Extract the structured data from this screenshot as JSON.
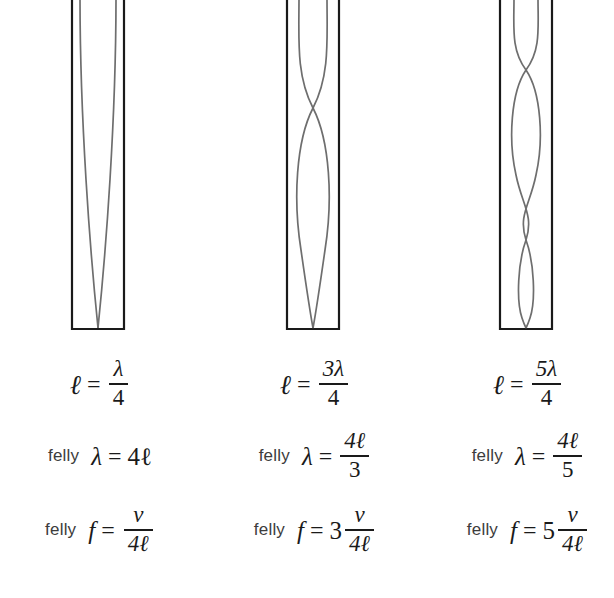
{
  "figure": {
    "type": "physics-diagram",
    "background_color": "#ffffff",
    "tube_outline_color": "#1a1a1a",
    "wave_color": "#6e6e6e"
  },
  "columns": [
    {
      "id": "harmonic-1",
      "tube": {
        "closed_end": "bottom",
        "open_end": "top",
        "antinodes": 1,
        "nodes": 1,
        "wave_lobes": 1
      },
      "length_eq": {
        "lhs": "ℓ",
        "equals": "=",
        "numerator": "λ",
        "denominator": "4"
      },
      "wavelength_eq": {
        "tag": "felly",
        "lhs": "λ",
        "equals": "=",
        "rhs_plain": "4ℓ",
        "numerator": null,
        "denominator": null
      },
      "frequency_eq": {
        "tag": "felly",
        "lhs": "f",
        "equals": "=",
        "coefficient": "",
        "numerator": "v",
        "denominator": "4ℓ"
      }
    },
    {
      "id": "harmonic-3",
      "tube": {
        "closed_end": "bottom",
        "open_end": "top",
        "antinodes": 2,
        "nodes": 2,
        "wave_lobes": 3
      },
      "length_eq": {
        "lhs": "ℓ",
        "equals": "=",
        "numerator": "3λ",
        "denominator": "4"
      },
      "wavelength_eq": {
        "tag": "felly",
        "lhs": "λ",
        "equals": "=",
        "rhs_plain": null,
        "numerator": "4ℓ",
        "denominator": "3"
      },
      "frequency_eq": {
        "tag": "felly",
        "lhs": "f",
        "equals": "=",
        "coefficient": "3",
        "numerator": "v",
        "denominator": "4ℓ"
      }
    },
    {
      "id": "harmonic-5",
      "tube": {
        "closed_end": "bottom",
        "open_end": "top",
        "antinodes": 3,
        "nodes": 3,
        "wave_lobes": 5
      },
      "length_eq": {
        "lhs": "ℓ",
        "equals": "=",
        "numerator": "5λ",
        "denominator": "4"
      },
      "wavelength_eq": {
        "tag": "felly",
        "lhs": "λ",
        "equals": "=",
        "rhs_plain": null,
        "numerator": "4ℓ",
        "denominator": "5"
      },
      "frequency_eq": {
        "tag": "felly",
        "lhs": "f",
        "equals": "=",
        "coefficient": "5",
        "numerator": "v",
        "denominator": "4ℓ"
      }
    }
  ]
}
